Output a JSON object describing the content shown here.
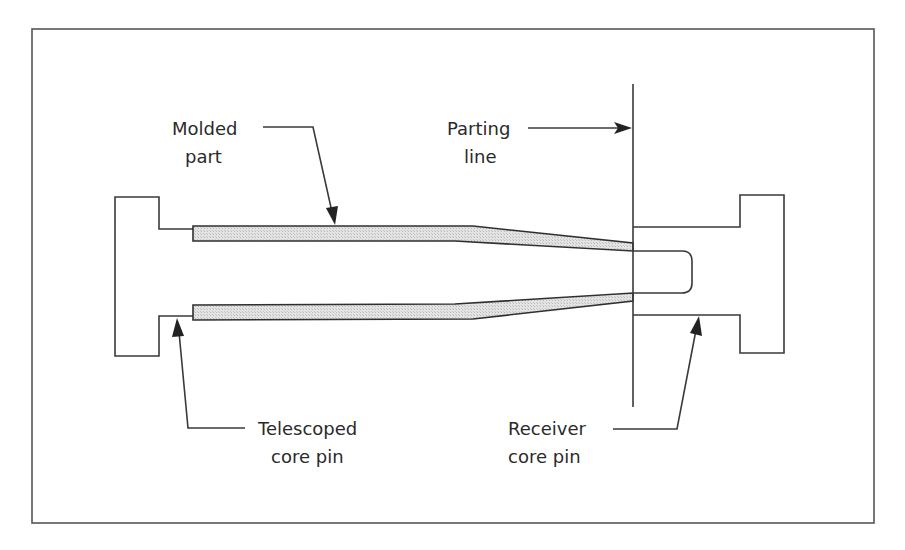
{
  "diagram": {
    "colors": {
      "line": "#3a3a3a",
      "part_fill": "#d9d9d9",
      "background": "#ffffff"
    },
    "labels": {
      "molded_part": {
        "line1": "Molded",
        "line2": "part"
      },
      "parting_line": {
        "line1": "Parting",
        "line2": "line"
      },
      "telescoped_core_pin": {
        "line1": "Telescoped",
        "line2": "core pin"
      },
      "receiver_core_pin": {
        "line1": "Receiver",
        "line2": "core pin"
      }
    }
  }
}
